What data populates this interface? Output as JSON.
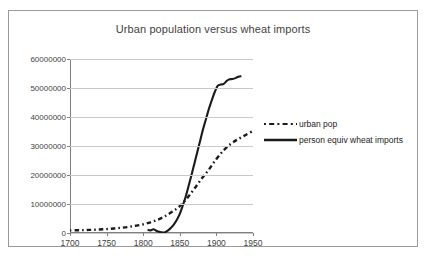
{
  "chart_data": {
    "type": "line",
    "title": "Urban population versus wheat imports",
    "xlabel": "",
    "ylabel": "",
    "xlim": [
      1700,
      1950
    ],
    "ylim": [
      0,
      60000000
    ],
    "grid": true,
    "legend_position": "right",
    "x_ticks": [
      "1700",
      "1750",
      "1800",
      "1850",
      "1900",
      "1950"
    ],
    "y_ticks": [
      "0",
      "10000000",
      "20000000",
      "30000000",
      "40000000",
      "50000000",
      "60000000"
    ],
    "series": [
      {
        "name": "urban pop",
        "style": "dash-dot",
        "color": "#1a1a1a",
        "x": [
          1700,
          1710,
          1720,
          1730,
          1740,
          1750,
          1760,
          1770,
          1780,
          1790,
          1800,
          1810,
          1820,
          1830,
          1840,
          1850,
          1860,
          1870,
          1880,
          1890,
          1900,
          1910,
          1920,
          1930,
          1940,
          1950
        ],
        "y": [
          900000,
          950000,
          1000000,
          1100000,
          1200000,
          1350000,
          1550000,
          1800000,
          2100000,
          2500000,
          3000000,
          3700000,
          4600000,
          5800000,
          7400000,
          9300000,
          12000000,
          15300000,
          18800000,
          22000000,
          25500000,
          28500000,
          30800000,
          32400000,
          33800000,
          35200000
        ]
      },
      {
        "name": "person equiv wheat imports",
        "style": "solid",
        "color": "#1a1a1a",
        "x": [
          1806,
          1810,
          1814,
          1818,
          1822,
          1826,
          1830,
          1834,
          1838,
          1842,
          1846,
          1850,
          1854,
          1858,
          1862,
          1866,
          1870,
          1874,
          1878,
          1882,
          1886,
          1890,
          1894,
          1898,
          1902,
          1906,
          1910,
          1914,
          1918,
          1922,
          1926,
          1930,
          1934
        ],
        "y": [
          1100000,
          900000,
          1300000,
          800000,
          400000,
          200000,
          300000,
          900000,
          1800000,
          3000000,
          4600000,
          6600000,
          9400000,
          12500000,
          16200000,
          20000000,
          24000000,
          28000000,
          32000000,
          36000000,
          39500000,
          43000000,
          46000000,
          48800000,
          50800000,
          51200000,
          51400000,
          52400000,
          53000000,
          53100000,
          53400000,
          53900000,
          54100000
        ]
      }
    ]
  },
  "legend": {
    "items": [
      {
        "label": "urban pop",
        "style": "dash-dot"
      },
      {
        "label": "person equiv wheat imports",
        "style": "solid"
      }
    ]
  }
}
